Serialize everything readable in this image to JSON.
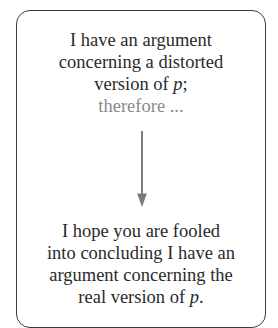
{
  "diagram": {
    "premise": {
      "lines": [
        "I have an argument",
        "concerning a distorted",
        "version of "
      ],
      "variable": "p",
      "variable_suffix": ";",
      "continuation": "therefore ..."
    },
    "arrow": {
      "direction": "down",
      "color": "#7a7a7a"
    },
    "conclusion": {
      "lines": [
        "I hope you are fooled",
        "into concluding I have an",
        "argument concerning the",
        "real version of "
      ],
      "variable": "p",
      "variable_suffix": "."
    },
    "colors": {
      "border": "#3a3a3a",
      "text": "#2a2a2a",
      "muted_text": "#8a8a8a"
    }
  }
}
